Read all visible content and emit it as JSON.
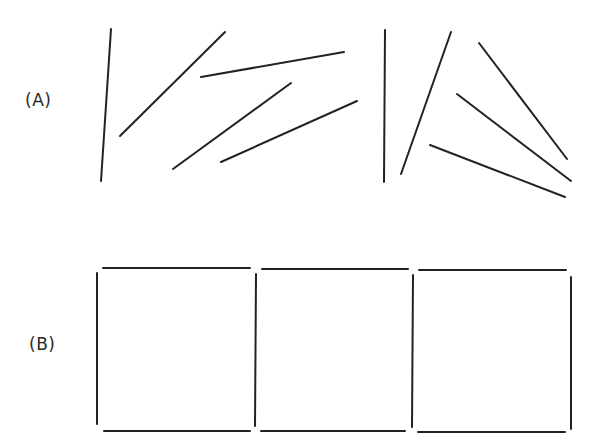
{
  "figure": {
    "stroke_color": "#222222",
    "background_color": "#ffffff",
    "stroke_width": 2,
    "panels": [
      {
        "label": "(A)",
        "description": "Randomly oriented line segments",
        "segments": [
          {
            "x1": 111,
            "y1": 29,
            "x2": 101,
            "y2": 181
          },
          {
            "x1": 225,
            "y1": 32,
            "x2": 120,
            "y2": 136
          },
          {
            "x1": 201,
            "y1": 77,
            "x2": 344,
            "y2": 52
          },
          {
            "x1": 173,
            "y1": 169,
            "x2": 291,
            "y2": 83
          },
          {
            "x1": 221,
            "y1": 162,
            "x2": 357,
            "y2": 101
          },
          {
            "x1": 385,
            "y1": 30,
            "x2": 384,
            "y2": 182
          },
          {
            "x1": 451,
            "y1": 32,
            "x2": 401,
            "y2": 174
          },
          {
            "x1": 479,
            "y1": 43,
            "x2": 567,
            "y2": 159
          },
          {
            "x1": 457,
            "y1": 94,
            "x2": 571,
            "y2": 181
          },
          {
            "x1": 430,
            "y1": 145,
            "x2": 565,
            "y2": 197
          }
        ]
      },
      {
        "label": "(B)",
        "description": "Same segments arranged into three adjacent squares",
        "segments": [
          {
            "x1": 103,
            "y1": 268,
            "x2": 250,
            "y2": 268
          },
          {
            "x1": 262,
            "y1": 269,
            "x2": 408,
            "y2": 269
          },
          {
            "x1": 419,
            "y1": 270,
            "x2": 566,
            "y2": 270
          },
          {
            "x1": 97,
            "y1": 273,
            "x2": 97,
            "y2": 424
          },
          {
            "x1": 256,
            "y1": 274,
            "x2": 255,
            "y2": 426
          },
          {
            "x1": 413,
            "y1": 275,
            "x2": 412,
            "y2": 427
          },
          {
            "x1": 571,
            "y1": 277,
            "x2": 571,
            "y2": 429
          },
          {
            "x1": 104,
            "y1": 431,
            "x2": 250,
            "y2": 431
          },
          {
            "x1": 261,
            "y1": 431,
            "x2": 405,
            "y2": 431
          },
          {
            "x1": 418,
            "y1": 432,
            "x2": 565,
            "y2": 432
          }
        ]
      }
    ]
  }
}
